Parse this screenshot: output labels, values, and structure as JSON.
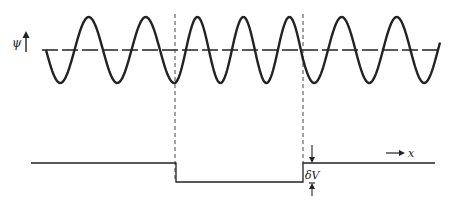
{
  "figure": {
    "y_axis_label": "ψ",
    "x_axis_label": "x",
    "step_label": "δV",
    "colors": {
      "ink": "#222222",
      "background": "#ffffff"
    }
  },
  "wave": {
    "midline_y": 50,
    "amplitude": 33,
    "regions": [
      {
        "name": "left",
        "x_start": 46,
        "x_end": 175,
        "wavelength": 57
      },
      {
        "name": "well",
        "x_start": 175,
        "x_end": 303,
        "wavelength": 46
      },
      {
        "name": "right",
        "x_start": 303,
        "x_end": 440,
        "wavelength": 55
      }
    ]
  },
  "potential": {
    "high_y": 163,
    "low_y": 182,
    "x_start": 31,
    "well_left_x": 176,
    "well_right_x": 303,
    "x_end": 435
  },
  "boundaries": [
    175,
    303
  ]
}
